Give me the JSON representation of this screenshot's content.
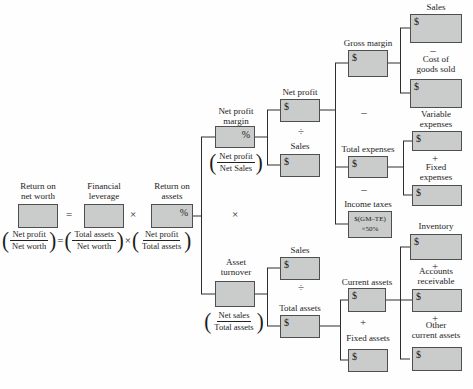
{
  "colors": {
    "box_fill": "#cacccb",
    "box_border": "#4f4f4f",
    "line": "#2e2e2e",
    "text": "#1c1c1c"
  },
  "operators": {
    "equals": "=",
    "multiply": "×",
    "divide": "÷",
    "plus": "+",
    "minus": "–"
  },
  "equation_row": {
    "return_on_net_worth": {
      "label": [
        "Return on",
        "net worth"
      ]
    },
    "financial_leverage": {
      "label": [
        "Financial",
        "leverage"
      ]
    },
    "return_on_assets": {
      "label": [
        "Return on",
        "assets"
      ],
      "symbol": "%"
    }
  },
  "formula_row": {
    "net_profit_over_net_worth": {
      "numerator": "Net profit",
      "denominator": "Net worth"
    },
    "total_assets_over_net_worth": {
      "numerator": "Total assets",
      "denominator": "Net worth"
    },
    "net_profit_over_total_assets": {
      "numerator": "Net profit",
      "denominator": "Total assets"
    }
  },
  "tree": {
    "net_profit_margin": {
      "label": [
        "Net profit",
        "margin"
      ],
      "symbol": "%",
      "formula": {
        "numerator": "Net profit",
        "denominator": "Net Sales"
      }
    },
    "asset_turnover": {
      "label": [
        "Asset",
        "turnover"
      ],
      "formula": {
        "numerator": "Net sales",
        "denominator": "Total assets"
      }
    },
    "net_profit": {
      "label": "Net profit",
      "symbol": "$"
    },
    "sales_npm": {
      "label": "Sales",
      "symbol": "$"
    },
    "gross_margin": {
      "label": "Gross margin",
      "symbol": "$"
    },
    "total_expenses": {
      "label": "Total expenses",
      "symbol": "$"
    },
    "income_taxes": {
      "label": "Income taxes",
      "box_text": [
        "$(GM–TE)",
        "×50%"
      ]
    },
    "sales_top": {
      "label": "Sales",
      "symbol": "$"
    },
    "cost_of_goods_sold": {
      "label": [
        "Cost of",
        "goods sold"
      ],
      "symbol": "$"
    },
    "variable_expenses": {
      "label": [
        "Variable",
        "expenses"
      ],
      "symbol": "$"
    },
    "fixed_expenses": {
      "label": [
        "Fixed",
        "expenses"
      ],
      "symbol": "$"
    },
    "sales_at": {
      "label": "Sales",
      "symbol": "$"
    },
    "total_assets": {
      "label": "Total assets",
      "symbol": "$"
    },
    "current_assets": {
      "label": "Current assets",
      "symbol": "$"
    },
    "fixed_assets": {
      "label": "Fixed assets",
      "symbol": "$"
    },
    "inventory": {
      "label": "Inventory",
      "symbol": "$"
    },
    "accounts_receivable": {
      "label": [
        "Accounts",
        "receivable"
      ],
      "symbol": "$"
    },
    "other_current_assets": {
      "label": [
        "Other",
        "current assets"
      ],
      "symbol": "$"
    }
  }
}
